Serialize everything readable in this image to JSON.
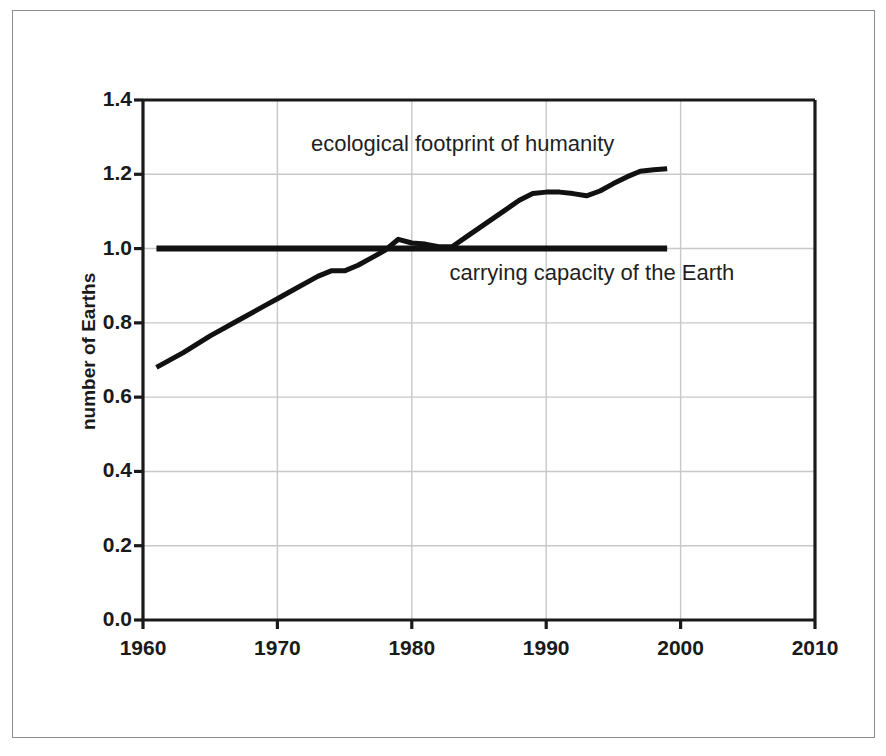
{
  "figure": {
    "background_color": "#ffffff",
    "frame_color": "#8c8c8c",
    "plot_line_color": "#111111",
    "grid_color": "#c8c8c8",
    "axis_color": "#1a1a1a"
  },
  "chart_data": {
    "type": "line",
    "title": "",
    "subtitle": "",
    "xlabel": "",
    "ylabel": "number of Earths",
    "xlim": [
      1960,
      2010
    ],
    "ylim": [
      0.0,
      1.4
    ],
    "grid": true,
    "legend_position": "inline-annotation",
    "x_ticks": [
      1960,
      1970,
      1980,
      1990,
      2000,
      2010
    ],
    "x_tick_labels": [
      "1960",
      "1970",
      "1980",
      "1990",
      "2000",
      "2010"
    ],
    "y_ticks": [
      0.0,
      0.2,
      0.4,
      0.6,
      0.8,
      1.0,
      1.2,
      1.4
    ],
    "y_tick_labels": [
      "0.0",
      "0.2",
      "0.4",
      "0.6",
      "0.8",
      "1.0",
      "1.2",
      "1.4"
    ],
    "annotations": [
      {
        "name": "ecological-footprint-label",
        "text": "ecological footprint of humanity",
        "x": 1972.5,
        "y": 1.275
      },
      {
        "name": "carrying-capacity-label",
        "text": "carrying capacity of the Earth",
        "x": 1982.8,
        "y": 0.93
      }
    ],
    "series": [
      {
        "name": "ecological footprint of humanity",
        "color": "#111111",
        "linewidth": 5,
        "x": [
          1961,
          1963,
          1965,
          1967,
          1969,
          1970,
          1971,
          1973,
          1974,
          1975,
          1976,
          1977,
          1978,
          1979,
          1980,
          1981,
          1982,
          1983,
          1984,
          1985,
          1986,
          1987,
          1988,
          1989,
          1990,
          1991,
          1992,
          1993,
          1994,
          1995,
          1996,
          1997,
          1998,
          1999
        ],
        "values": [
          0.68,
          0.72,
          0.765,
          0.805,
          0.845,
          0.865,
          0.885,
          0.925,
          0.94,
          0.94,
          0.955,
          0.975,
          0.995,
          1.025,
          1.015,
          1.012,
          1.005,
          1.005,
          1.03,
          1.055,
          1.08,
          1.105,
          1.13,
          1.148,
          1.152,
          1.152,
          1.148,
          1.142,
          1.155,
          1.175,
          1.193,
          1.208,
          1.212,
          1.215
        ]
      },
      {
        "name": "carrying capacity of the Earth",
        "color": "#111111",
        "linewidth": 6,
        "x": [
          1961,
          1999
        ],
        "values": [
          1.0,
          1.0
        ]
      }
    ]
  }
}
